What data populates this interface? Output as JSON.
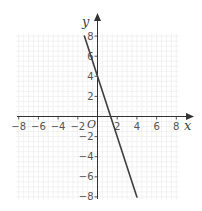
{
  "chart_data": {
    "type": "line",
    "title": "",
    "xlabel": "x",
    "ylabel": "y",
    "origin_label": "O",
    "xlim": [
      -8,
      8
    ],
    "ylim": [
      -8,
      8
    ],
    "grid": true,
    "minor_grid_step": 0.5,
    "x_ticks": [
      -8,
      -6,
      -4,
      -2,
      2,
      4,
      6,
      8
    ],
    "y_ticks": [
      8,
      6,
      4,
      2,
      -2,
      -4,
      -6,
      -8
    ],
    "x_tick_labels": [
      "−8",
      "−6",
      "−4",
      "−2",
      "2",
      "4",
      "6",
      "8"
    ],
    "y_tick_labels": [
      "8",
      "6",
      "4",
      "2",
      "−2",
      "−4",
      "−6",
      "−8"
    ],
    "series": [
      {
        "name": "line",
        "equation": "y = -3x + 4",
        "x": [
          -1.333,
          4
        ],
        "y": [
          8,
          -8
        ],
        "color": "#404040"
      }
    ]
  },
  "style": {
    "axis_color": "#333333",
    "grid_color": "#ececec",
    "line_color": "#404040"
  }
}
